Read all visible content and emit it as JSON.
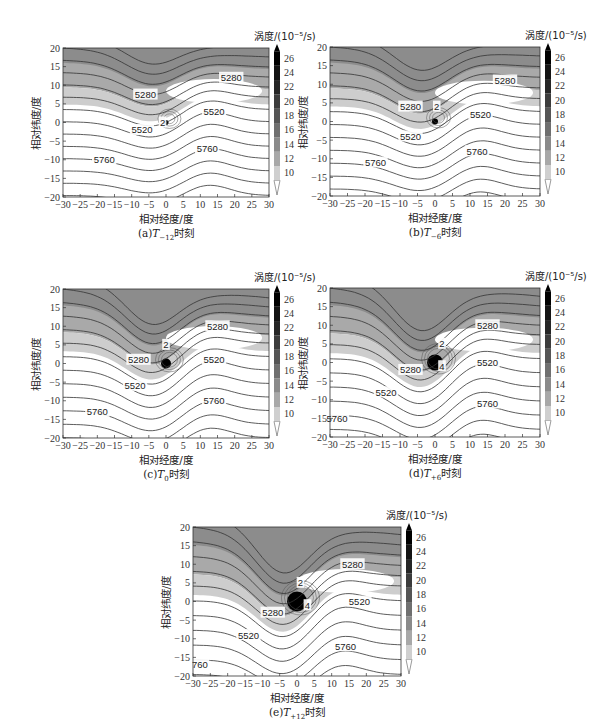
{
  "chart_data": [
    {
      "type": "heatmap",
      "panel": "a",
      "title": "(a)T-12时刻",
      "caption_prefix": "(a)",
      "caption_T": "T",
      "caption_sub": "−12",
      "caption_suffix": "时刻",
      "xlabel": "相对经度/度",
      "ylabel": "相对纬度/度",
      "xlim": [
        -30,
        30
      ],
      "ylim": [
        -20,
        20
      ],
      "xticks": [
        -30,
        -25,
        -20,
        -15,
        -10,
        -5,
        0,
        5,
        10,
        15,
        20,
        25,
        30
      ],
      "yticks": [
        20,
        15,
        10,
        5,
        0,
        -5,
        -10,
        -15,
        -20
      ],
      "colorbar": {
        "label": "涡度/(10⁻⁵/s)",
        "ticks": [
          10,
          12,
          14,
          16,
          18,
          20,
          22,
          24,
          26
        ]
      },
      "contour_labels": [
        {
          "text": "5280",
          "x": -6,
          "y": 7.5
        },
        {
          "text": "5280",
          "x": 19,
          "y": 12
        },
        {
          "text": "5520",
          "x": -7,
          "y": -2
        },
        {
          "text": "5520",
          "x": 14,
          "y": 3
        },
        {
          "text": "5760",
          "x": -18,
          "y": -10
        },
        {
          "text": "5760",
          "x": 12,
          "y": -7
        },
        {
          "text": "2",
          "x": -1,
          "y": 0
        }
      ],
      "vortex_center": [
        0,
        0
      ]
    },
    {
      "type": "heatmap",
      "panel": "b",
      "title": "(b)T-6时刻",
      "caption_prefix": "(b)",
      "caption_T": "T",
      "caption_sub": "−6",
      "caption_suffix": "时刻",
      "xlabel": "相对经度/度",
      "ylabel": "相对纬度/度",
      "xlim": [
        -30,
        30
      ],
      "ylim": [
        -20,
        20
      ],
      "xticks": [
        -30,
        -25,
        -20,
        -15,
        -10,
        -5,
        0,
        5,
        10,
        15,
        20,
        25,
        30
      ],
      "yticks": [
        20,
        15,
        10,
        5,
        0,
        -5,
        -10,
        -15,
        -20
      ],
      "colorbar": {
        "label": "涡度/(10⁻⁵/s)",
        "ticks": [
          10,
          12,
          14,
          16,
          18,
          20,
          22,
          24,
          26
        ]
      },
      "contour_labels": [
        {
          "text": "5280",
          "x": -7,
          "y": 4
        },
        {
          "text": "5280",
          "x": 20,
          "y": 11
        },
        {
          "text": "5520",
          "x": -7,
          "y": -4
        },
        {
          "text": "5520",
          "x": 13,
          "y": 2
        },
        {
          "text": "5760",
          "x": -17,
          "y": -11
        },
        {
          "text": "5760",
          "x": 12,
          "y": -8
        },
        {
          "text": "2",
          "x": 0.5,
          "y": 4
        }
      ],
      "vortex_center": [
        0,
        0
      ]
    },
    {
      "type": "heatmap",
      "panel": "c",
      "title": "(c)T0时刻",
      "caption_prefix": "(c)",
      "caption_T": "T",
      "caption_sub": "0",
      "caption_suffix": "时刻",
      "xlabel": "相对经度/度",
      "ylabel": "相对纬度/度",
      "xlim": [
        -30,
        30
      ],
      "ylim": [
        -20,
        20
      ],
      "xticks": [
        -30,
        -25,
        -20,
        -15,
        -10,
        -5,
        0,
        5,
        10,
        15,
        20,
        25,
        30
      ],
      "yticks": [
        20,
        15,
        10,
        5,
        0,
        -5,
        -10,
        -15,
        -20
      ],
      "colorbar": {
        "label": "涡度/(10⁻⁵/s)",
        "ticks": [
          10,
          12,
          14,
          16,
          18,
          20,
          22,
          24,
          26
        ]
      },
      "contour_labels": [
        {
          "text": "5280",
          "x": -8,
          "y": 1
        },
        {
          "text": "5280",
          "x": 15,
          "y": 10
        },
        {
          "text": "5520",
          "x": -9,
          "y": -6
        },
        {
          "text": "5520",
          "x": 14,
          "y": 1
        },
        {
          "text": "5760",
          "x": -20,
          "y": -13
        },
        {
          "text": "5760",
          "x": 14,
          "y": -10
        },
        {
          "text": "2",
          "x": 0,
          "y": 5
        }
      ],
      "vortex_center": [
        0,
        0
      ]
    },
    {
      "type": "heatmap",
      "panel": "d",
      "title": "(d)T+6时刻",
      "caption_prefix": "(d)",
      "caption_T": "T",
      "caption_sub": "+6",
      "caption_suffix": "时刻",
      "xlabel": "相对经度/度",
      "ylabel": "相对纬度/度",
      "xlim": [
        -30,
        30
      ],
      "ylim": [
        -20,
        20
      ],
      "xticks": [
        -30,
        -25,
        -20,
        -15,
        -10,
        -5,
        0,
        5,
        10,
        15,
        20,
        25,
        30
      ],
      "yticks": [
        20,
        15,
        10,
        5,
        0,
        -5,
        -10,
        -15,
        -20
      ],
      "colorbar": {
        "label": "涡度/(10⁻⁵/s)",
        "ticks": [
          10,
          12,
          14,
          16,
          18,
          20,
          22,
          24,
          26
        ]
      },
      "contour_labels": [
        {
          "text": "5280",
          "x": -7,
          "y": -2
        },
        {
          "text": "5280",
          "x": 15,
          "y": 10
        },
        {
          "text": "5520",
          "x": -14,
          "y": -8
        },
        {
          "text": "5520",
          "x": 15,
          "y": 0
        },
        {
          "text": "5760",
          "x": -28,
          "y": -15
        },
        {
          "text": "5760",
          "x": 15,
          "y": -11
        },
        {
          "text": "2",
          "x": 2,
          "y": 5
        },
        {
          "text": "4",
          "x": 2,
          "y": -1
        }
      ],
      "vortex_center": [
        0,
        0
      ]
    },
    {
      "type": "heatmap",
      "panel": "e",
      "title": "(e)T+12时刻",
      "caption_prefix": "(e)",
      "caption_T": "T",
      "caption_sub": "+12",
      "caption_suffix": "时刻",
      "xlabel": "相对经度/度",
      "ylabel": "相对纬度/度",
      "xlim": [
        -30,
        30
      ],
      "ylim": [
        -20,
        20
      ],
      "xticks": [
        -30,
        -25,
        -20,
        -15,
        -10,
        -5,
        0,
        5,
        10,
        15,
        20,
        25,
        30
      ],
      "yticks": [
        20,
        15,
        10,
        5,
        0,
        -5,
        -10,
        -15,
        -20
      ],
      "colorbar": {
        "label": "涡度/(10⁻⁵/s)",
        "ticks": [
          10,
          12,
          14,
          16,
          18,
          20,
          22,
          24,
          26
        ]
      },
      "contour_labels": [
        {
          "text": "5280",
          "x": -7,
          "y": -3
        },
        {
          "text": "5280",
          "x": 16,
          "y": 10
        },
        {
          "text": "5520",
          "x": -14,
          "y": -9
        },
        {
          "text": "5520",
          "x": 18,
          "y": 0
        },
        {
          "text": "760",
          "x": -28,
          "y": -17
        },
        {
          "text": "5760",
          "x": 14,
          "y": -12
        },
        {
          "text": "2",
          "x": 1,
          "y": 5
        },
        {
          "text": "4",
          "x": 3,
          "y": -1
        }
      ],
      "vortex_center": [
        0,
        0
      ]
    }
  ],
  "colors": {
    "shade_dark": "#8c8c8c",
    "shade_mid": "#a9a9a9",
    "shade_light": "#cdcdcd",
    "contour": "#333333",
    "vortex_core": "#000000"
  }
}
